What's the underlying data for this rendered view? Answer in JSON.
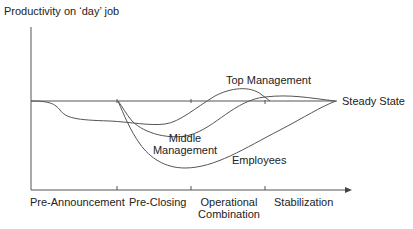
{
  "diagram": {
    "y_axis_label": "Productivity on ‘day’ job",
    "baseline_label": "Steady State",
    "phases": [
      {
        "label": "Pre-Announcement"
      },
      {
        "label": "Pre-Closing"
      },
      {
        "label_line1": "Operational",
        "label_line2": "Combination"
      },
      {
        "label": "Stabilization"
      }
    ],
    "curves": [
      {
        "label": "Top Management"
      },
      {
        "label_line1": "Middle",
        "label_line2": "Management"
      },
      {
        "label": "Employees"
      }
    ],
    "colors": {
      "line": "#555555",
      "text": "#222222"
    }
  }
}
